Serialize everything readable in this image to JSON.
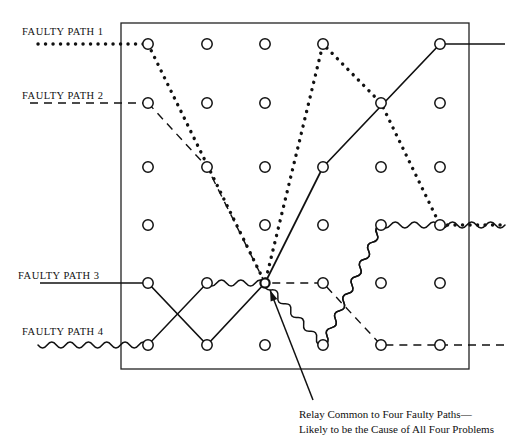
{
  "diagram": {
    "frame": {
      "x": 121,
      "y": 23,
      "width": 348,
      "height": 346,
      "stroke": "#222222"
    },
    "hub": {
      "x": 265,
      "y": 283,
      "label": "common-relay-node"
    },
    "grid": {
      "columns_x": [
        148,
        207,
        265,
        323,
        381,
        440
      ],
      "rows_y": [
        44,
        103,
        167,
        225,
        283,
        345
      ],
      "node_radius": 5.2,
      "node_stroke": "#111111",
      "node_fill": "#ffffff"
    },
    "colors": {
      "ink": "#111111",
      "frame": "#222222",
      "text": "#121212"
    },
    "labels": {
      "path1": "FAULTY PATH 1",
      "path2": "FAULTY PATH 2",
      "path3": "FAULTY PATH 3",
      "path4": "FAULTY PATH 4"
    },
    "caption": {
      "line1": "Relay Common to Four Faulty Paths—",
      "line2": "Likely to be the Cause of All Four Problems"
    },
    "arrow": {
      "from_x": 313,
      "from_y": 400,
      "to_x": 270,
      "to_y": 290,
      "name": "callout-arrow"
    },
    "paths": [
      {
        "id": "path1",
        "name": "faulty-path-1",
        "style": "dotted",
        "stroke_width": 3.4,
        "dash": "0.1 7.4",
        "lead_in": {
          "x1": 38,
          "y1": 44,
          "x2": 148,
          "y2": 44
        },
        "points": [
          [
            148,
            44
          ],
          [
            265,
            283
          ],
          [
            323,
            44
          ],
          [
            381,
            103
          ],
          [
            440,
            225
          ]
        ],
        "lead_out": {
          "x1": 440,
          "y1": 225,
          "x2": 505,
          "y2": 225
        },
        "nodes": [
          [
            148,
            44
          ],
          [
            323,
            44
          ],
          [
            381,
            103
          ],
          [
            440,
            225
          ]
        ]
      },
      {
        "id": "path2",
        "name": "faulty-path-2",
        "style": "dashed",
        "stroke_width": 1.4,
        "dash": "8 6",
        "lead_in": {
          "x1": 30,
          "y1": 103,
          "x2": 148,
          "y2": 103
        },
        "points": [
          [
            148,
            103
          ],
          [
            207,
            167
          ],
          [
            265,
            283
          ],
          [
            323,
            283
          ],
          [
            381,
            345
          ],
          [
            440,
            345
          ]
        ],
        "lead_out": {
          "x1": 440,
          "y1": 345,
          "x2": 505,
          "y2": 345
        },
        "nodes": [
          [
            148,
            103
          ],
          [
            207,
            167
          ],
          [
            323,
            283
          ],
          [
            381,
            345
          ],
          [
            440,
            345
          ]
        ]
      },
      {
        "id": "path3",
        "name": "faulty-path-3",
        "style": "solid",
        "stroke_width": 1.7,
        "dash": "",
        "lead_in": {
          "x1": 40,
          "y1": 283,
          "x2": 148,
          "y2": 283
        },
        "points": [
          [
            148,
            283
          ],
          [
            207,
            345
          ],
          [
            265,
            283
          ],
          [
            323,
            167
          ],
          [
            440,
            44
          ]
        ],
        "lead_out": {
          "x1": 440,
          "y1": 44,
          "x2": 505,
          "y2": 44
        },
        "nodes": [
          [
            148,
            283
          ],
          [
            207,
            345
          ],
          [
            323,
            167
          ],
          [
            440,
            44
          ]
        ]
      },
      {
        "id": "path4",
        "name": "faulty-path-4",
        "style": "wavy",
        "stroke_width": 1.5,
        "dash": "",
        "amplitude": 3.1,
        "wavelength": 9.5,
        "lead_in": {
          "x1": 38,
          "y1": 345,
          "x2": 148,
          "y2": 345
        },
        "points": [
          [
            148,
            345
          ],
          [
            207,
            283
          ],
          [
            265,
            283
          ],
          [
            323,
            345
          ],
          [
            381,
            225
          ]
        ],
        "lead_out": {
          "x1": 381,
          "y1": 225,
          "x2": 505,
          "y2": 225
        },
        "nodes": [
          [
            148,
            345
          ],
          [
            207,
            283
          ],
          [
            323,
            345
          ],
          [
            381,
            225
          ]
        ],
        "straight_segments": [
          [
            [
              148,
              345
            ],
            [
              207,
              283
            ]
          ]
        ]
      },
      {
        "id": "path4-extra-leg",
        "name": "faulty-path-4-riser",
        "style": "wavy",
        "stroke_width": 1.5,
        "dash": "",
        "amplitude": 3.1,
        "wavelength": 9.5,
        "points": [
          [
            323,
            345
          ],
          [
            381,
            225
          ]
        ],
        "nodes": []
      }
    ],
    "plain_nodes": [
      [
        207,
        44
      ],
      [
        265,
        44
      ],
      [
        440,
        103
      ],
      [
        265,
        103
      ],
      [
        207,
        103
      ],
      [
        148,
        167
      ],
      [
        207,
        167
      ],
      [
        265,
        167
      ],
      [
        381,
        167
      ],
      [
        440,
        167
      ],
      [
        148,
        225
      ],
      [
        265,
        225
      ],
      [
        323,
        225
      ],
      [
        381,
        283
      ],
      [
        440,
        283
      ],
      [
        265,
        345
      ]
    ]
  }
}
